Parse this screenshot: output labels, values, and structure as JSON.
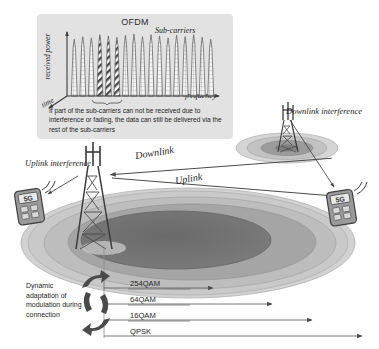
{
  "ofdm": {
    "title": "OFDM",
    "subcarriers_label": "Sub-carriers",
    "y_axis_label": "received power",
    "x_axis_label": "frequency",
    "depth_axis_label": "time",
    "caption": "If part of the sub-carriers can not be received due to interference or fading, the data can still be delivered via the rest of the sub-carriers"
  },
  "chart_data": {
    "type": "bar",
    "title": "OFDM",
    "xlabel": "frequency",
    "ylabel": "received power",
    "grid": false,
    "legend_position": "none",
    "categories": [
      "1",
      "2",
      "3",
      "4",
      "5",
      "6",
      "7",
      "8",
      "9",
      "10",
      "11",
      "12",
      "13",
      "14",
      "15",
      "16",
      "17"
    ],
    "values": [
      88,
      92,
      90,
      95,
      93,
      91,
      94,
      96,
      92,
      95,
      93,
      90,
      94,
      92,
      95,
      91,
      88
    ],
    "fill_styles": [
      "grid",
      "grid",
      "grid",
      "hatch",
      "hatch",
      "hatch",
      "grid",
      "grid",
      "grid",
      "grid",
      "grid",
      "grid",
      "grid",
      "grid",
      "grid",
      "grid",
      "grid"
    ],
    "annotations": [
      {
        "text": "Sub-carriers",
        "target": "upper-right sub-carrier group"
      },
      {
        "text": "brace marks the lost sub-carriers",
        "target": "sub-carriers 4-6"
      }
    ],
    "ylim": [
      0,
      100
    ]
  },
  "diagram": {
    "downlink_label": "Downlink",
    "uplink_label": "Uplink",
    "uplink_interference_label": "Uplink\ninterference",
    "downlink_interference_label": "Downlink\ninterference",
    "serving_tower_name": "base-station-tower",
    "neighbor_tower_name": "interfering-tower",
    "device_label": "5G"
  },
  "modulation": {
    "description": "Dynamic adaptation of modulation during connection",
    "schemes": [
      {
        "label": "254QAM",
        "range": 0.3
      },
      {
        "label": "64QAM",
        "range": 0.52
      },
      {
        "label": "16QAM",
        "range": 0.74
      },
      {
        "label": "QPSK",
        "range": 0.96
      }
    ]
  },
  "colors": {
    "panel_bg": "#e2e2e2",
    "ink": "#1d1d1d",
    "cell_ring_outer": "#cfcfcf",
    "cell_ring_mid": "#b4b4b4",
    "cell_ring_inner": "#8f8f8f",
    "cell_core": "#6e6e6e",
    "device_body": "#8a8a8a"
  }
}
